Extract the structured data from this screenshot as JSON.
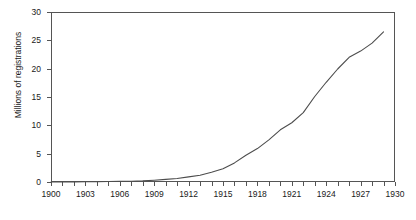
{
  "chart_data": {
    "type": "line",
    "title": "",
    "xlabel": "",
    "ylabel": "Millions of registrations",
    "xlim": [
      1900,
      1930
    ],
    "ylim": [
      0,
      30
    ],
    "grid": false,
    "legend": "none",
    "line_color": "#4d4d4d",
    "axis_color": "#555555",
    "text_color": "#1a1a1a",
    "ytick_labels": [
      "0",
      "5",
      "10",
      "15",
      "20",
      "25",
      "30"
    ],
    "ytick_values": [
      0,
      5,
      10,
      15,
      20,
      25,
      30
    ],
    "xtick_labels": [
      "1900",
      "1903",
      "1906",
      "1909",
      "1912",
      "1915",
      "1918",
      "1921",
      "1924",
      "1927",
      "1930"
    ],
    "xtick_label_values": [
      1900,
      1903,
      1906,
      1909,
      1912,
      1915,
      1918,
      1921,
      1924,
      1927,
      1930
    ],
    "xtick_minor_values": [
      1900,
      1901,
      1902,
      1903,
      1904,
      1905,
      1906,
      1907,
      1908,
      1909,
      1910,
      1911,
      1912,
      1913,
      1914,
      1915,
      1916,
      1917,
      1918,
      1919,
      1920,
      1921,
      1922,
      1923,
      1924,
      1925,
      1926,
      1927,
      1928,
      1929,
      1930
    ],
    "x": [
      1900,
      1901,
      1902,
      1903,
      1904,
      1905,
      1906,
      1907,
      1908,
      1909,
      1910,
      1911,
      1912,
      1913,
      1914,
      1915,
      1916,
      1917,
      1918,
      1919,
      1920,
      1921,
      1922,
      1923,
      1924,
      1925,
      1926,
      1927,
      1928,
      1929
    ],
    "values": [
      0.008,
      0.015,
      0.023,
      0.033,
      0.055,
      0.078,
      0.106,
      0.143,
      0.194,
      0.306,
      0.458,
      0.619,
      0.902,
      1.19,
      1.71,
      2.33,
      3.37,
      4.73,
      5.9,
      7.44,
      9.21,
      10.46,
      12.24,
      15.09,
      17.6,
      19.94,
      22.0,
      23.1,
      24.5,
      26.5
    ],
    "value_at_1930_approx": 23,
    "series_name": "Automobile registrations"
  }
}
